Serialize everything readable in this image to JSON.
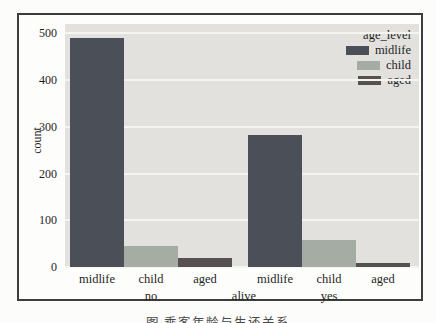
{
  "figure": {
    "caption": "图 乘客年龄与生还关系"
  },
  "chart_data": {
    "type": "bar",
    "title": "",
    "ylabel": "count",
    "xlabel": "alive",
    "ylim": [
      0,
      520
    ],
    "yticks": [
      0,
      100,
      200,
      300,
      400,
      500
    ],
    "grid": true,
    "groups": [
      {
        "label": "no",
        "categories": [
          "midlife",
          "child",
          "aged"
        ],
        "values": [
          490,
          45,
          20
        ]
      },
      {
        "label": "yes",
        "categories": [
          "midlife",
          "child",
          "aged"
        ],
        "values": [
          283,
          57,
          9
        ]
      }
    ],
    "legend": {
      "title": "age_level",
      "position": "upper right",
      "entries": [
        {
          "label": "midlife",
          "color": "#4b5058"
        },
        {
          "label": "child",
          "color": "#a4aca3"
        },
        {
          "label": "aged",
          "color": "#565150"
        }
      ]
    },
    "colors": {
      "plot_background": "#e2e1de",
      "gridline": "#f4f4f1",
      "figure_background": "#fdfdfb",
      "border": "#3d3d3d",
      "text": "#1f1f1f"
    }
  }
}
